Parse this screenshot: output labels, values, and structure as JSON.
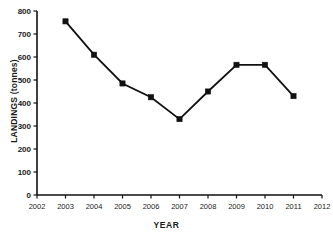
{
  "chart_data": {
    "type": "line",
    "title": "",
    "subtitle": "",
    "xlabel": "YEAR",
    "ylabel": "LANDINGS (tonnes)",
    "x": [
      2003,
      2004,
      2005,
      2006,
      2007,
      2008,
      2009,
      2010,
      2011
    ],
    "values": [
      755,
      610,
      485,
      425,
      330,
      450,
      566,
      566,
      430
    ],
    "series": [
      {
        "name": "Landings",
        "values": [
          755,
          610,
          485,
          425,
          330,
          450,
          566,
          566,
          430
        ]
      }
    ],
    "xlim": [
      2002,
      2012
    ],
    "ylim": [
      0,
      800
    ],
    "xticks": [
      2002,
      2003,
      2004,
      2005,
      2006,
      2007,
      2008,
      2009,
      2010,
      2011,
      2012
    ],
    "xtick_labels": [
      "2002",
      "2003",
      "2004",
      "2005",
      "2006",
      "2007",
      "2008",
      "2009",
      "2010",
      "2011",
      "2012"
    ],
    "yticks": [
      0,
      100,
      200,
      300,
      400,
      500,
      600,
      700,
      800
    ],
    "ytick_labels": [
      "0",
      "100",
      "200",
      "300",
      "400",
      "500",
      "600",
      "700",
      "800"
    ],
    "grid": false,
    "legend": false,
    "legend_position": "none",
    "marker": "square",
    "marker_color": "#111111",
    "line_color": "#111111",
    "background_color": "#ffffff"
  }
}
